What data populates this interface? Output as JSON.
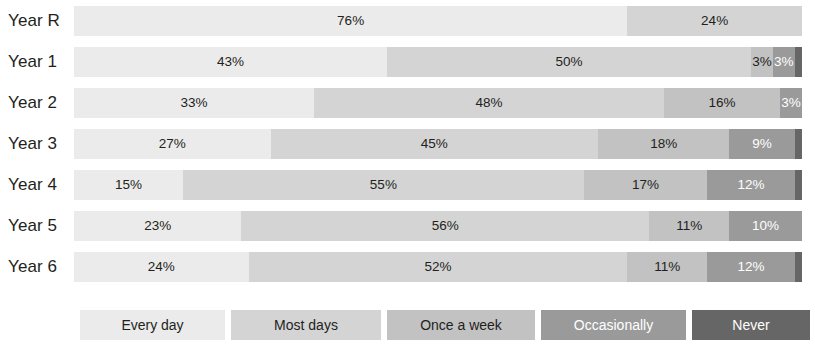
{
  "chart_data": {
    "type": "bar",
    "orientation": "horizontal",
    "stacked": true,
    "normalized_percent": true,
    "title": "",
    "xlabel": "",
    "ylabel": "",
    "xlim": [
      0,
      100
    ],
    "grid": false,
    "legend_position": "bottom",
    "categories": [
      "Year R",
      "Year 1",
      "Year 2",
      "Year 3",
      "Year 4",
      "Year 5",
      "Year 6"
    ],
    "series": [
      {
        "name": "Every day",
        "color": "#ebebeb",
        "text_color": "#231f20",
        "values": [
          76,
          43,
          33,
          27,
          15,
          23,
          24
        ],
        "labels": [
          "76%",
          "43%",
          "33%",
          "27%",
          "15%",
          "23%",
          "24%"
        ]
      },
      {
        "name": "Most days",
        "color": "#d4d4d4",
        "text_color": "#231f20",
        "values": [
          24,
          50,
          48,
          45,
          55,
          56,
          52
        ],
        "labels": [
          "24%",
          "50%",
          "48%",
          "45%",
          "55%",
          "56%",
          "52%"
        ]
      },
      {
        "name": "Once a week",
        "color": "#c2c2c2",
        "text_color": "#231f20",
        "values": [
          0,
          3,
          16,
          18,
          17,
          11,
          11
        ],
        "labels": [
          "",
          "3%",
          "16%",
          "18%",
          "17%",
          "11%",
          "11%"
        ]
      },
      {
        "name": "Occasionally",
        "color": "#9a9a9a",
        "text_color": "#ffffff",
        "values": [
          0,
          3,
          3,
          9,
          12,
          10,
          12
        ],
        "labels": [
          "",
          "3%",
          "3%",
          "9%",
          "12%",
          "10%",
          "12%"
        ]
      },
      {
        "name": "Never",
        "color": "#666666",
        "text_color": "#ffffff",
        "values": [
          0,
          1,
          0,
          1,
          1,
          0,
          1
        ],
        "labels": [
          "",
          "",
          "",
          "",
          "",
          "",
          ""
        ]
      }
    ],
    "legend": [
      {
        "label": "Every day",
        "color": "#ebebeb",
        "text_color": "#231f20"
      },
      {
        "label": "Most days",
        "color": "#d4d4d4",
        "text_color": "#231f20"
      },
      {
        "label": "Once a week",
        "color": "#c2c2c2",
        "text_color": "#231f20"
      },
      {
        "label": "Occasionally",
        "color": "#9a9a9a",
        "text_color": "#ffffff"
      },
      {
        "label": "Never",
        "color": "#666666",
        "text_color": "#ffffff"
      }
    ]
  },
  "layout": {
    "row_tops": [
      6,
      47,
      88,
      129,
      170,
      211,
      252
    ],
    "bar_left": 80,
    "bar_width": 728,
    "legend_widths": [
      145,
      150,
      148,
      145,
      118
    ]
  }
}
